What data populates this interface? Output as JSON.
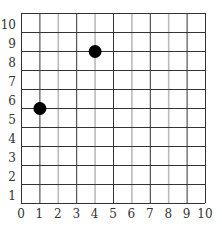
{
  "chart_data": {
    "type": "scatter",
    "title": "",
    "xlabel": "",
    "ylabel": "",
    "xlim": [
      0,
      10
    ],
    "ylim": [
      0,
      10
    ],
    "grid": true,
    "legend": null,
    "x_ticks": [
      "0",
      "1",
      "2",
      "3",
      "4",
      "5",
      "6",
      "7",
      "8",
      "9",
      "10"
    ],
    "y_ticks": [
      "1",
      "2",
      "3",
      "4",
      "5",
      "6",
      "7",
      "8",
      "9",
      "10"
    ],
    "points": [
      {
        "x": 4,
        "y": 8
      },
      {
        "x": 1,
        "y": 5
      }
    ],
    "colors": {
      "grid_major": "#333333",
      "grid_minor": "#bbbbbb",
      "point": "#000000",
      "text": "#333333"
    }
  }
}
